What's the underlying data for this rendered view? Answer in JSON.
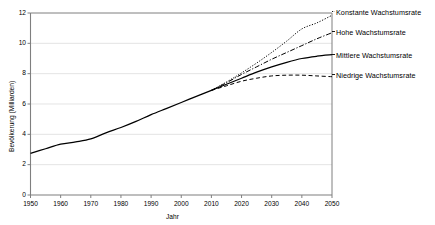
{
  "chart_data": {
    "type": "line",
    "title": "",
    "xlabel": "Jahr",
    "ylabel": "Bevölkerung (Milliarden)",
    "xlim": [
      1950,
      2050
    ],
    "ylim": [
      0,
      12
    ],
    "xticks": [
      1950,
      1960,
      1970,
      1980,
      1990,
      2000,
      2010,
      2020,
      2030,
      2040,
      2050
    ],
    "yticks": [
      0,
      2,
      4,
      6,
      8,
      10,
      12
    ],
    "grid": true,
    "legend_position": "right",
    "series": [
      {
        "name": "Konstante Wachstumsrate",
        "style": "dotted",
        "color": "#000000",
        "x": [
          2010,
          2015,
          2020,
          2025,
          2030,
          2035,
          2040,
          2045,
          2050
        ],
        "values": [
          6.9,
          7.45,
          8.05,
          8.7,
          9.4,
          10.15,
          10.95,
          11.35,
          11.85
        ]
      },
      {
        "name": "Hohe Wachstumsrate",
        "style": "dashdot",
        "color": "#000000",
        "x": [
          2010,
          2015,
          2020,
          2025,
          2030,
          2035,
          2040,
          2045,
          2050
        ],
        "values": [
          6.9,
          7.4,
          7.95,
          8.45,
          8.95,
          9.4,
          9.85,
          10.3,
          10.7
        ]
      },
      {
        "name": "Mittlere Wachstumsrate",
        "style": "solid",
        "color": "#000000",
        "x": [
          1950,
          1955,
          1960,
          1965,
          1970,
          1975,
          1980,
          1985,
          1990,
          1995,
          2000,
          2005,
          2010,
          2015,
          2020,
          2025,
          2030,
          2035,
          2040,
          2045,
          2050
        ],
        "values": [
          2.75,
          3.05,
          3.35,
          3.5,
          3.7,
          4.1,
          4.45,
          4.85,
          5.3,
          5.7,
          6.1,
          6.5,
          6.9,
          7.3,
          7.7,
          8.1,
          8.45,
          8.75,
          9.0,
          9.15,
          9.25
        ]
      },
      {
        "name": "Niedrige Wachstumsrate",
        "style": "dashed",
        "color": "#000000",
        "x": [
          2010,
          2015,
          2020,
          2025,
          2030,
          2035,
          2040,
          2045,
          2050
        ],
        "values": [
          6.9,
          7.2,
          7.5,
          7.7,
          7.85,
          7.9,
          7.9,
          7.85,
          7.8
        ]
      }
    ]
  },
  "axes": {
    "y_tick_labels": [
      "12",
      "10",
      "8",
      "6",
      "4",
      "2",
      "0"
    ],
    "x_tick_labels": [
      "1950",
      "1960",
      "1970",
      "1980",
      "1990",
      "2000",
      "2010",
      "2020",
      "2030",
      "2040",
      "2050"
    ],
    "x_title": "Jahr",
    "y_title": "Bevölkerung (Milliarden)"
  },
  "legend": {
    "items": [
      {
        "label": "Konstante Wachstumsrate"
      },
      {
        "label": "Hohe Wachstumsrate"
      },
      {
        "label": "Mittlere Wachstumsrate"
      },
      {
        "label": "Niedrige Wachstumsrate"
      }
    ]
  },
  "colors": {
    "line": "#000000",
    "grid": "#d9d9d9",
    "axis": "#7f7f7f",
    "background": "#ffffff"
  }
}
